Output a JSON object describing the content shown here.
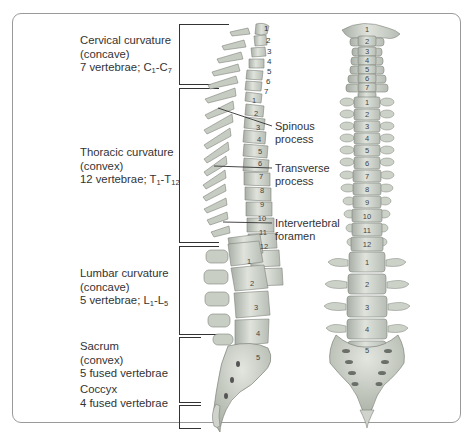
{
  "regions": [
    {
      "name": "Cervical curvature",
      "type": "(concave)",
      "count_prefix": "7 vertebrae; ",
      "range": {
        "a": "C",
        "a_sub": "1",
        "sep": "-",
        "b": "C",
        "b_sub": "7"
      }
    },
    {
      "name": "Thoracic curvature",
      "type": "(convex)",
      "count_prefix": "12 vertebrae; ",
      "range": {
        "a": "T",
        "a_sub": "1",
        "sep": "-",
        "b": "T",
        "b_sub": "12"
      }
    },
    {
      "name": "Lumbar curvature",
      "type": "(concave)",
      "count_prefix": "5 vertebrae; ",
      "range": {
        "a": "L",
        "a_sub": "1",
        "sep": "-",
        "b": "L",
        "b_sub": "5"
      }
    },
    {
      "name": "Sacrum",
      "type": "(convex)",
      "count": "5 fused vertebrae"
    },
    {
      "name": "Coccyx",
      "count": "4 fused vertebrae"
    }
  ],
  "callouts": [
    {
      "line1": "Spinous",
      "line2": "process"
    },
    {
      "line1": "Transverse",
      "line2": "process"
    },
    {
      "line1": "Intervertebral",
      "line2": "foramen"
    }
  ],
  "lateral_view": {
    "cervical_numbers": [
      "1",
      "2",
      "3",
      "4",
      "5",
      "6",
      "7"
    ],
    "thoracic_numbers": [
      "1",
      "2",
      "3",
      "4",
      "5",
      "6",
      "7",
      "8",
      "9",
      "10",
      "11",
      "12"
    ],
    "lumbar_numbers": [
      "1",
      "2",
      "3",
      "4",
      "5"
    ]
  },
  "anterior_view": {
    "cervical_numbers": [
      "1",
      "2",
      "3",
      "4",
      "5",
      "6",
      "7"
    ],
    "thoracic_numbers": [
      "1",
      "2",
      "3",
      "4",
      "5",
      "6",
      "7",
      "8",
      "9",
      "10",
      "11",
      "12"
    ],
    "lumbar_numbers": [
      "1",
      "2",
      "3",
      "4",
      "5"
    ]
  },
  "colors": {
    "bone": "#d9ddd6",
    "bone_shade": "#b9bfb6",
    "bone_dark": "#8e948b",
    "frame": "#9a9a9a",
    "text": "#333333"
  }
}
